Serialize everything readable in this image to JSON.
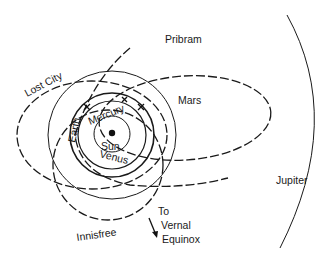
{
  "diagram": {
    "center": {
      "label": "Sun"
    },
    "planets": [
      {
        "name": "Mercury",
        "label": "Mercury"
      },
      {
        "name": "Venus",
        "label": "Venus"
      },
      {
        "name": "Earth",
        "label": "Earth"
      },
      {
        "name": "Mars",
        "label": "Mars"
      },
      {
        "name": "Jupiter",
        "label": "Jupiter"
      }
    ],
    "meteorite_orbits": [
      {
        "name": "Pribram",
        "label": "Pribram"
      },
      {
        "name": "Lost City",
        "label": "Lost City"
      },
      {
        "name": "Innisfree",
        "label": "Innisfree"
      }
    ],
    "direction": {
      "line1": "To",
      "line2": "Vernal",
      "line3": "Equinox"
    }
  }
}
